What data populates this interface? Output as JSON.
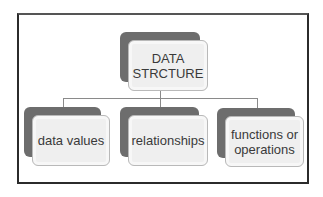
{
  "diagram": {
    "root": {
      "label_line1": "DATA",
      "label_line2": "STRCTURE"
    },
    "children": [
      {
        "label": "data values"
      },
      {
        "label_line1": "relationships"
      },
      {
        "label_line1": "functions or",
        "label_line2": "operations"
      }
    ]
  },
  "colors": {
    "frame_border": "#2b2b2b",
    "shadow_box": "#6d6d6d",
    "box_fill": "#efefef",
    "box_border": "#b9b9b9",
    "connector": "#8a8a8a",
    "text": "#3a3a3a"
  }
}
